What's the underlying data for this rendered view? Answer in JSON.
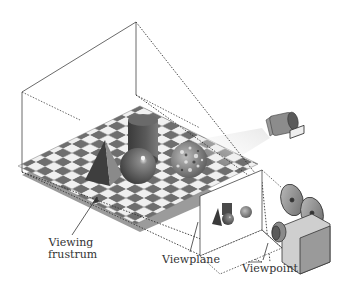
{
  "diagram": {
    "style": "grayscale isometric illustration",
    "colors": {
      "background": "#ffffff",
      "line": "#444444",
      "dark_tile": "#6e6e6e",
      "light_tile": "#f2f2f2",
      "floor_shadow": "#8a8a8a",
      "object_dark": "#4a4a4a",
      "object_mid": "#7a7a7a"
    },
    "labels": {
      "viewing_frustrum_line1": "Viewing",
      "viewing_frustrum_line2": "frustrum",
      "viewplane": "Viewplane",
      "viewpoint": "Viewpoint"
    },
    "scene_objects": [
      "pyramid",
      "cylinder",
      "sphere",
      "textured sphere"
    ],
    "viewplane_objects": [
      "pyramid",
      "cylinder",
      "sphere",
      "textured sphere"
    ],
    "props": [
      "spotlight",
      "movie camera"
    ]
  }
}
